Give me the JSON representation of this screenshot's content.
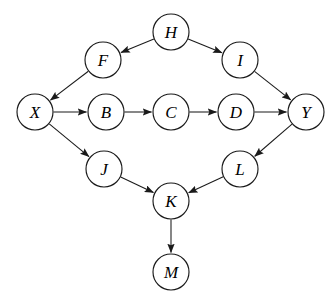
{
  "diagram": {
    "node_radius": 18,
    "node_fill": "#ffffff",
    "stroke_color": "#1a1a1a",
    "background": "#ffffff",
    "nodes": [
      {
        "id": "H",
        "label": "H",
        "cx": 171,
        "cy": 32
      },
      {
        "id": "F",
        "label": "F",
        "cx": 103,
        "cy": 60
      },
      {
        "id": "I",
        "label": "I",
        "cx": 240,
        "cy": 60
      },
      {
        "id": "X",
        "label": "X",
        "cx": 35,
        "cy": 112
      },
      {
        "id": "B",
        "label": "B",
        "cx": 106,
        "cy": 112
      },
      {
        "id": "C",
        "label": "C",
        "cx": 171,
        "cy": 112
      },
      {
        "id": "D",
        "label": "D",
        "cx": 236,
        "cy": 112
      },
      {
        "id": "Y",
        "label": "Y",
        "cx": 306,
        "cy": 112
      },
      {
        "id": "J",
        "label": "J",
        "cx": 104,
        "cy": 169
      },
      {
        "id": "L",
        "label": "L",
        "cx": 240,
        "cy": 169
      },
      {
        "id": "K",
        "label": "K",
        "cx": 171,
        "cy": 201
      },
      {
        "id": "M",
        "label": "M",
        "cx": 171,
        "cy": 272
      }
    ],
    "edges": [
      {
        "from": "H",
        "to": "F"
      },
      {
        "from": "H",
        "to": "I"
      },
      {
        "from": "F",
        "to": "X"
      },
      {
        "from": "I",
        "to": "Y"
      },
      {
        "from": "X",
        "to": "B"
      },
      {
        "from": "B",
        "to": "C"
      },
      {
        "from": "C",
        "to": "D"
      },
      {
        "from": "D",
        "to": "Y"
      },
      {
        "from": "X",
        "to": "J"
      },
      {
        "from": "Y",
        "to": "L"
      },
      {
        "from": "J",
        "to": "K"
      },
      {
        "from": "L",
        "to": "K"
      },
      {
        "from": "K",
        "to": "M"
      }
    ]
  }
}
